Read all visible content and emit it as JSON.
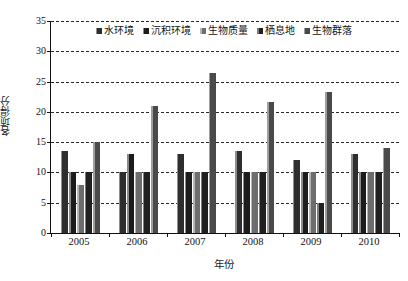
{
  "chart_data": {
    "type": "bar",
    "title": "",
    "xlabel": "年份",
    "ylabel": "各项得分",
    "categories": [
      "2005",
      "2006",
      "2007",
      "2008",
      "2009",
      "2010"
    ],
    "ylim": [
      0,
      35
    ],
    "yticks": [
      0,
      5,
      10,
      15,
      20,
      25,
      30,
      35
    ],
    "grid": true,
    "legend_position": "top-center",
    "series": [
      {
        "name": "水环境",
        "color": "#2e2e2e",
        "values": [
          13.5,
          10.0,
          13.0,
          13.5,
          12.0,
          13.0
        ]
      },
      {
        "name": "沉积环境",
        "color": "#1c1c1c",
        "values": [
          10.0,
          13.0,
          10.0,
          10.0,
          10.0,
          10.0
        ]
      },
      {
        "name": "生物质量",
        "color": "#6d6d6d",
        "values": [
          8.0,
          10.0,
          10.0,
          10.0,
          10.0,
          10.0
        ]
      },
      {
        "name": "栖息地",
        "color": "#202020",
        "values": [
          10.0,
          10.0,
          10.0,
          10.0,
          5.0,
          10.0
        ]
      },
      {
        "name": "生物群落",
        "color": "#4a4a4a",
        "values": [
          15.0,
          21.0,
          26.5,
          21.7,
          23.2,
          14.0
        ]
      }
    ]
  }
}
